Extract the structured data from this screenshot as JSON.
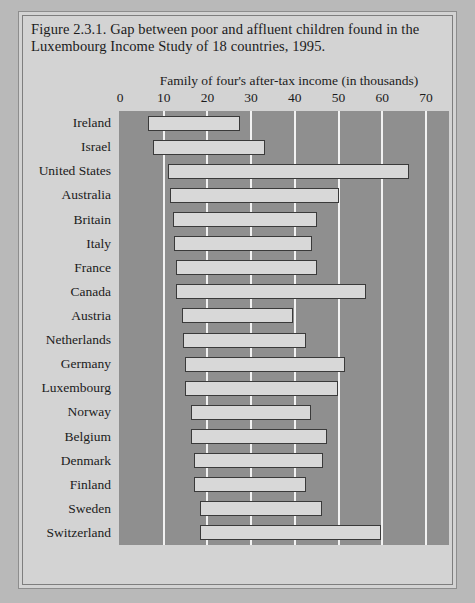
{
  "figure": {
    "caption": "Figure 2.3.1. Gap between poor and affluent children found in the Luxembourg Income Study of 18 countries, 1995."
  },
  "chart_data": {
    "type": "bar",
    "subtype": "floating-range-bar",
    "title": "Figure 2.3.1. Gap between poor and affluent children found in the Luxembourg Income Study of 18 countries, 1995.",
    "xlabel": "Family of four's after-tax income (in thousands)",
    "ylabel": "",
    "xlim": [
      0,
      73
    ],
    "xticks": [
      0,
      10,
      20,
      30,
      40,
      50,
      60,
      70
    ],
    "xticklabels": [
      "0",
      "10",
      "20",
      "30",
      "40",
      "50",
      "60",
      "70"
    ],
    "grid": "vertical",
    "legend": "none",
    "categories": [
      "Ireland",
      "Israel",
      "United States",
      "Australia",
      "Britain",
      "Italy",
      "France",
      "Canada",
      "Austria",
      "Netherlands",
      "Germany",
      "Luxembourg",
      "Norway",
      "Belgium",
      "Denmark",
      "Finland",
      "Sweden",
      "Switzerland"
    ],
    "series": [
      {
        "name": "Poor children (low end of range)",
        "values": [
          6.4,
          7.6,
          11.0,
          11.5,
          12.1,
          12.4,
          12.8,
          12.8,
          14.2,
          14.4,
          14.9,
          14.9,
          16.3,
          16.3,
          16.9,
          16.9,
          18.3,
          18.3
        ]
      },
      {
        "name": "Affluent children (high end of range)",
        "values": [
          27.5,
          33.2,
          66.1,
          50.1,
          45.1,
          43.9,
          45.1,
          56.3,
          39.6,
          42.6,
          51.5,
          49.9,
          43.7,
          47.4,
          46.5,
          42.6,
          46.2,
          59.7
        ]
      }
    ],
    "bars": [
      {
        "category": "Ireland",
        "low": 6.4,
        "high": 27.5
      },
      {
        "category": "Israel",
        "low": 7.6,
        "high": 33.2
      },
      {
        "category": "United States",
        "low": 11.0,
        "high": 66.1
      },
      {
        "category": "Australia",
        "low": 11.5,
        "high": 50.1
      },
      {
        "category": "Britain",
        "low": 12.1,
        "high": 45.1
      },
      {
        "category": "Italy",
        "low": 12.4,
        "high": 43.9
      },
      {
        "category": "France",
        "low": 12.8,
        "high": 45.1
      },
      {
        "category": "Canada",
        "low": 12.8,
        "high": 56.3
      },
      {
        "category": "Austria",
        "low": 14.2,
        "high": 39.6
      },
      {
        "category": "Netherlands",
        "low": 14.4,
        "high": 42.6
      },
      {
        "category": "Germany",
        "low": 14.9,
        "high": 51.5
      },
      {
        "category": "Luxembourg",
        "low": 14.9,
        "high": 49.9
      },
      {
        "category": "Norway",
        "low": 16.3,
        "high": 43.7
      },
      {
        "category": "Belgium",
        "low": 16.3,
        "high": 47.4
      },
      {
        "category": "Denmark",
        "low": 16.9,
        "high": 46.5
      },
      {
        "category": "Finland",
        "low": 16.9,
        "high": 42.6
      },
      {
        "category": "Sweden",
        "low": 18.3,
        "high": 46.2
      },
      {
        "category": "Switzerland",
        "low": 18.3,
        "high": 59.7
      }
    ],
    "colors": {
      "plot_background": "#8f8f8f",
      "figure_background": "#d3d3d3",
      "bar_fill": "#d8d8d8",
      "bar_border": "#3a3a3a",
      "gridline": "#f2f2f2",
      "text": "#1b1b1b"
    }
  }
}
